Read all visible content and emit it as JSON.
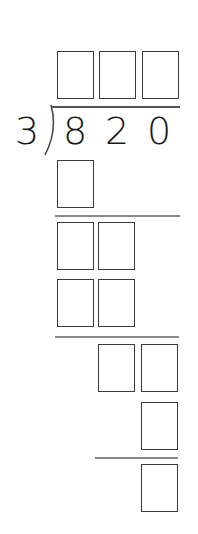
{
  "problem": {
    "divisor": "3",
    "dividend_digits": [
      "8",
      "2",
      "0"
    ]
  },
  "answer_boxes": {
    "quotient": [
      "",
      "",
      ""
    ],
    "step1_product": [
      ""
    ],
    "step2_bring_down": [
      "",
      ""
    ],
    "step2_product": [
      "",
      ""
    ],
    "step3_bring_down": [
      "",
      ""
    ],
    "step3_product": [
      ""
    ],
    "remainder": [
      ""
    ]
  },
  "colors": {
    "box_border": "#3a3a3a",
    "rule_line": "#8a8a8a",
    "text": "#1a1a1a"
  }
}
